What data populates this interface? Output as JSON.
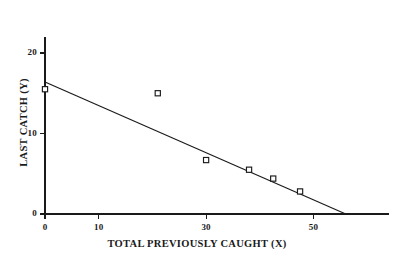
{
  "chart_data": {
    "type": "scatter",
    "title": "",
    "xlabel": "TOTAL PREVIOUSLY CAUGHT (X)",
    "ylabel": "LAST CATCH (Y)",
    "xlim": [
      0,
      64
    ],
    "ylim": [
      0,
      22
    ],
    "grid": false,
    "legend": null,
    "xticks": [
      {
        "value": 0,
        "label": "0"
      },
      {
        "value": 10,
        "label": "10"
      },
      {
        "value": 30,
        "label": "30"
      },
      {
        "value": 50,
        "label": "50"
      }
    ],
    "yticks": [
      {
        "value": 0,
        "label": "0"
      },
      {
        "value": 10,
        "label": "10"
      },
      {
        "value": 20,
        "label": "20"
      }
    ],
    "points": [
      {
        "x": 0,
        "y": 15.5
      },
      {
        "x": 21,
        "y": 15.0
      },
      {
        "x": 30,
        "y": 6.7
      },
      {
        "x": 38,
        "y": 5.5
      },
      {
        "x": 42.5,
        "y": 4.4
      },
      {
        "x": 47.5,
        "y": 2.8
      }
    ],
    "series": [
      {
        "name": "observations",
        "marker": "open-square",
        "x": [
          0,
          21,
          30,
          38,
          42.5,
          47.5
        ],
        "values": [
          15.5,
          15.0,
          6.7,
          5.5,
          4.4,
          2.8
        ]
      }
    ],
    "fit_line": {
      "name": "regression-line",
      "x": [
        0,
        56
      ],
      "y": [
        16.4,
        0.0
      ],
      "intercept": 16.4,
      "slope": -0.293
    }
  },
  "axes": {
    "x_title": "TOTAL PREVIOUSLY CAUGHT (X)",
    "y_title": "LAST CATCH (Y)"
  }
}
